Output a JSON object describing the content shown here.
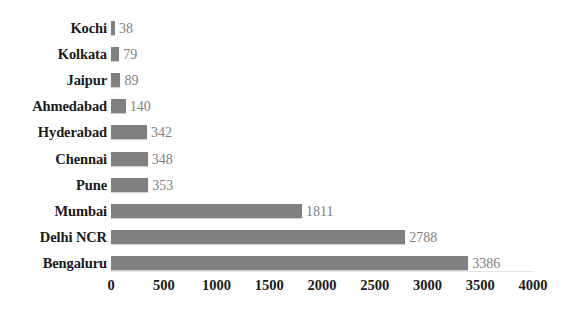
{
  "chart_data": {
    "type": "bar",
    "orientation": "horizontal",
    "title": "",
    "xlabel": "",
    "ylabel": "",
    "categories": [
      "Kochi",
      "Kolkata",
      "Jaipur",
      "Ahmedabad",
      "Hyderabad",
      "Chennai",
      "Pune",
      "Mumbai",
      "Delhi NCR",
      "Bengaluru"
    ],
    "values": [
      38,
      79,
      89,
      140,
      342,
      348,
      353,
      1811,
      2788,
      3386
    ],
    "data_labels": [
      "38",
      "79",
      "89",
      "140",
      "342",
      "348",
      "353",
      "1811",
      "2788",
      "3386"
    ],
    "xlim": [
      0,
      4000
    ],
    "xticks": [
      0,
      500,
      1000,
      1500,
      2000,
      2500,
      3000,
      3500,
      4000
    ],
    "xtick_labels": [
      "0",
      "500",
      "1000",
      "1500",
      "2000",
      "2500",
      "3000",
      "3500",
      "4000"
    ],
    "grid": false,
    "legend": false,
    "bar_color": "#808080",
    "data_label_color": "#808080",
    "axis_text_color": "#1a1a1a",
    "background_color": "#ffffff"
  }
}
